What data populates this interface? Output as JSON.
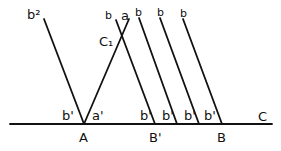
{
  "diagram": {
    "baseline": {
      "x1": 10,
      "y1": 124,
      "x2": 272,
      "y2": 124,
      "label": "C"
    },
    "points": [
      {
        "name": "A",
        "x": 84,
        "label": "A"
      },
      {
        "name": "B-prime",
        "x": 155,
        "label": "B'"
      },
      {
        "name": "B",
        "x": 222,
        "label": "B"
      }
    ],
    "lines": [
      {
        "name": "line-b2",
        "x1": 44,
        "y1": 19,
        "x2": 84,
        "y2": 124,
        "top_label": "b²",
        "bottom_label": "b'"
      },
      {
        "name": "line-a",
        "x1": 84,
        "y1": 124,
        "x2": 129,
        "y2": 19,
        "top_label": "a",
        "bottom_label": "a'"
      },
      {
        "name": "line-b-1",
        "x1": 116,
        "y1": 20,
        "x2": 155,
        "y2": 124,
        "top_label": "b",
        "bottom_label": "b'"
      },
      {
        "name": "line-b-2",
        "x1": 139,
        "y1": 18,
        "x2": 177,
        "y2": 124,
        "top_label": "b",
        "bottom_label": "b'"
      },
      {
        "name": "line-b-3",
        "x1": 160,
        "y1": 18,
        "x2": 199,
        "y2": 124,
        "top_label": "b",
        "bottom_label": "b'"
      },
      {
        "name": "line-b-4",
        "x1": 183,
        "y1": 19,
        "x2": 222,
        "y2": 124,
        "top_label": "b",
        "bottom_label": "b'"
      }
    ],
    "intersection_label": "C₁",
    "labels": {
      "b2": "b²",
      "a_top": "a",
      "b_top": "b",
      "b_prime": "b'",
      "a_prime": "a'",
      "A": "A",
      "B_prime": "B'",
      "B": "B",
      "C": "C",
      "C1": "C₁"
    }
  }
}
